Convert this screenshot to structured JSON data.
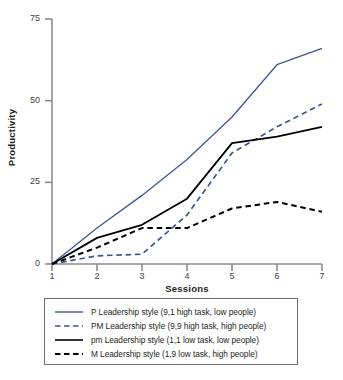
{
  "chart_data": {
    "type": "line",
    "title": "",
    "xlabel": "Sessions",
    "ylabel": "Productivity",
    "x": [
      1,
      2,
      3,
      4,
      5,
      6,
      7
    ],
    "xlim": [
      1,
      7
    ],
    "ylim": [
      0,
      75
    ],
    "xticks": [
      "1",
      "2",
      "3",
      "4",
      "5",
      "6",
      "7"
    ],
    "yticks": [
      "0",
      "25",
      "50",
      "75"
    ],
    "grid": false,
    "legend_position": "below-plot",
    "series": [
      {
        "name": "P Leadership style (9,1 high task, low people)",
        "short": "P",
        "color": "#3d5694",
        "style": "solid",
        "values": [
          0,
          11,
          21,
          32,
          45,
          61,
          66
        ]
      },
      {
        "name": "PM Leadership style (9,9 high task, high people)",
        "short": "PM",
        "color": "#3d5694",
        "style": "dashed",
        "values": [
          0,
          2.5,
          3,
          15,
          34,
          42,
          49
        ]
      },
      {
        "name": "pm Leadership style (1,1 low task, low people)",
        "short": "pm",
        "color": "#000000",
        "style": "solid",
        "values": [
          0,
          8,
          12,
          20,
          37,
          39,
          42
        ]
      },
      {
        "name": "M Leadership style (1,9 low task, high people)",
        "short": "M",
        "color": "#000000",
        "style": "dashed",
        "values": [
          0,
          5,
          11,
          11,
          17,
          19,
          16
        ]
      }
    ]
  },
  "legend": {
    "items": [
      {
        "label": "P Leadership style (9,1 high task, low people)"
      },
      {
        "label": "PM Leadership style (9,9 high task, high people)"
      },
      {
        "label": "pm Leadership style (1,1 low task, low people)"
      },
      {
        "label": "M Leadership style (1,9 low task, high people)"
      }
    ]
  },
  "axes": {
    "y_title": "Productivity",
    "x_title": "Sessions",
    "y_ticks": [
      "75",
      "50",
      "25",
      "0"
    ],
    "x_ticks": [
      "1",
      "2",
      "3",
      "4",
      "5",
      "6",
      "7"
    ]
  },
  "colors": {
    "blue": "#3d5694",
    "black": "#000000",
    "axis": "#8c8c8f",
    "text": "#231f20"
  }
}
